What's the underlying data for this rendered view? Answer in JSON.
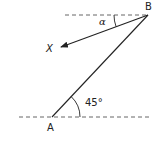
{
  "diagram": {
    "type": "geometry",
    "points": {
      "A": {
        "label": "A",
        "x": 52,
        "y": 117
      },
      "B": {
        "label": "B",
        "x": 148,
        "y": 15
      },
      "X": {
        "label": "X",
        "x": 60,
        "y": 47
      }
    },
    "angles": {
      "at_A": {
        "label": "45°",
        "value_deg": 45
      },
      "at_B": {
        "label": "α"
      }
    },
    "lines": [
      {
        "from": "A",
        "to": "B",
        "style": "solid"
      },
      {
        "from": "B",
        "to": "X",
        "style": "solid-arrow"
      },
      {
        "name": "horizontal-through-B",
        "style": "dashed"
      },
      {
        "name": "horizontal-through-A",
        "style": "dashed"
      }
    ],
    "colors": {
      "stroke": "#222222",
      "background": "#ffffff"
    }
  }
}
